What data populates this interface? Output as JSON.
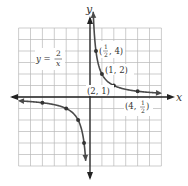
{
  "chart_data": {
    "type": "line",
    "title": "",
    "xlabel": "x",
    "ylabel": "y",
    "xlim": [
      -6,
      6
    ],
    "ylim": [
      -6,
      6
    ],
    "grid": true,
    "equation_label": {
      "lhs": "y =",
      "num": "2",
      "den": "x"
    },
    "series": [
      {
        "name": "y = 2/x (x > 0)",
        "points": [
          [
            0.25,
            8
          ],
          [
            0.5,
            4
          ],
          [
            1,
            2
          ],
          [
            2,
            1
          ],
          [
            4,
            0.5
          ],
          [
            5.8,
            0.345
          ]
        ]
      },
      {
        "name": "y = 2/x (x < 0)",
        "points": [
          [
            -5.8,
            -0.345
          ],
          [
            -4,
            -0.5
          ],
          [
            -2,
            -1
          ],
          [
            -1,
            -2
          ],
          [
            -0.5,
            -4
          ],
          [
            -0.36,
            -5.5
          ]
        ]
      }
    ],
    "annotations": [
      {
        "point": [
          0.5,
          4
        ],
        "text_num": "1",
        "text_den": "2",
        "text_rest": ", 4)"
      },
      {
        "point": [
          1,
          2
        ],
        "text": "(1, 2)"
      },
      {
        "point": [
          2,
          1
        ],
        "text": "(2, 1)"
      },
      {
        "point": [
          4,
          0.5
        ],
        "text_pre": "(4, ",
        "text_num": "1",
        "text_den": "2",
        "text_post": ")"
      }
    ]
  },
  "labels": {
    "x_axis": "x",
    "y_axis": "y",
    "eq_lhs": "y =",
    "eq_num": "2",
    "eq_den": "x",
    "p1_open": "(",
    "p1_num": "1",
    "p1_den": "2",
    "p1_rest": ", 4)",
    "p2": "(1, 2)",
    "p3": "(2, 1)",
    "p4_pre": "(4,",
    "p4_num": "1",
    "p4_den": "2",
    "p4_post": ")"
  }
}
